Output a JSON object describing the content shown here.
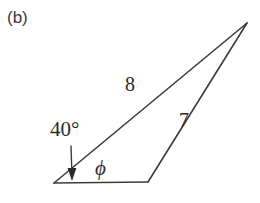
{
  "figure": {
    "panel_label": "(b)",
    "background_color": "#ffffff",
    "stroke_color": "#3c3c3c",
    "text_color": "#2b2b2b",
    "labels": {
      "side_long": "8",
      "side_short": "7",
      "angle_known": "40°",
      "angle_unknown": "ϕ"
    },
    "geometry": {
      "left_vertex": [
        54,
        183
      ],
      "base_right_vertex": [
        148,
        182
      ],
      "apex": [
        247,
        23
      ],
      "arrow_tail": [
        71,
        146
      ],
      "arrow_tip": [
        72,
        179
      ]
    }
  }
}
